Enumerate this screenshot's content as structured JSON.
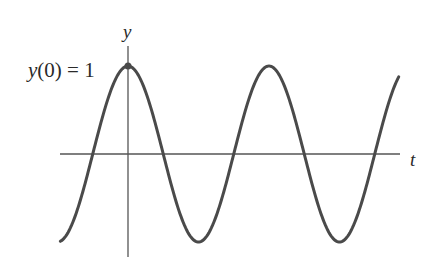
{
  "chart_data": {
    "type": "line",
    "title": "",
    "xlabel": "t",
    "ylabel": "y",
    "function": "y(t) = cos(ωt)",
    "annotations": [
      {
        "text": "y(0) = 1",
        "at": {
          "t": 0,
          "y": 1
        },
        "marker": "point"
      }
    ],
    "series": [
      {
        "name": "y(t)",
        "color": "#4a4a4a",
        "x_periods": [
          -0.48,
          1.92
        ],
        "points": [
          {
            "t_period": 0,
            "y": 1
          },
          {
            "t_period": 0.25,
            "y": 0
          },
          {
            "t_period": 0.5,
            "y": -1
          },
          {
            "t_period": 0.75,
            "y": 0
          },
          {
            "t_period": 1.0,
            "y": 1
          },
          {
            "t_period": 1.25,
            "y": 0
          },
          {
            "t_period": 1.5,
            "y": -1
          },
          {
            "t_period": 1.75,
            "y": 0
          }
        ]
      }
    ],
    "ylim": [
      -1,
      1
    ],
    "grid": false,
    "legend": null
  },
  "labels": {
    "y_axis": "y",
    "t_axis": "t",
    "initial_condition": "y(0) = 1"
  },
  "style": {
    "axis_color": "#555555",
    "curve_color": "#4a4a4a"
  }
}
